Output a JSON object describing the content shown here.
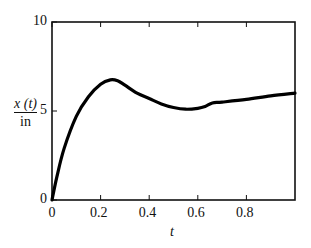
{
  "chart_data": {
    "type": "line",
    "title": "",
    "xlabel": "t",
    "ylabel_num": "x (t)",
    "ylabel_den": "in",
    "xlim": [
      0,
      1
    ],
    "ylim": [
      0,
      10
    ],
    "xticks": [
      "0",
      "0.2",
      "0.4",
      "0.6",
      "0.8"
    ],
    "yticks": [
      "0",
      "5",
      "10"
    ],
    "grid": false,
    "series": [
      {
        "name": "x(t)",
        "x": [
          0,
          0.02,
          0.05,
          0.1,
          0.15,
          0.2,
          0.24,
          0.27,
          0.3,
          0.35,
          0.4,
          0.45,
          0.5,
          0.55,
          0.6,
          0.63,
          0.66,
          0.7,
          0.8,
          0.9,
          1.0
        ],
        "y": [
          0,
          1.3,
          2.9,
          4.7,
          5.8,
          6.5,
          6.75,
          6.7,
          6.45,
          6.0,
          5.7,
          5.4,
          5.2,
          5.1,
          5.15,
          5.25,
          5.45,
          5.5,
          5.65,
          5.85,
          6.0
        ]
      }
    ]
  }
}
